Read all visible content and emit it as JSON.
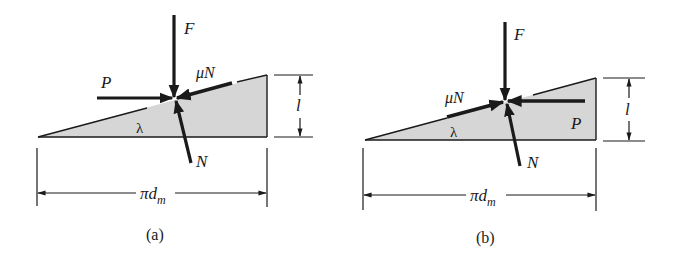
{
  "figure": {
    "colors": {
      "wedge_fill": "#d6d6d6",
      "stroke": "#1a1a1a",
      "background": "#ffffff"
    },
    "panels": [
      {
        "id": "a",
        "caption": "(a)",
        "labels": {
          "F": "F",
          "muN": "μN",
          "P": "P",
          "lambda": "λ",
          "N": "N",
          "lead": "l",
          "circumference": "πd",
          "circumference_sub": "m"
        },
        "forces": [
          {
            "name": "F",
            "direction": "downward"
          },
          {
            "name": "P",
            "direction": "rightward"
          },
          {
            "name": "μN",
            "direction": "down-slope toward contact point"
          },
          {
            "name": "N",
            "direction": "normal to incline, upward"
          }
        ]
      },
      {
        "id": "b",
        "caption": "(b)",
        "labels": {
          "F": "F",
          "muN": "μN",
          "P": "P",
          "lambda": "λ",
          "N": "N",
          "lead": "l",
          "circumference": "πd",
          "circumference_sub": "m"
        },
        "forces": [
          {
            "name": "F",
            "direction": "downward"
          },
          {
            "name": "P",
            "direction": "leftward"
          },
          {
            "name": "μN",
            "direction": "up-slope toward contact point"
          },
          {
            "name": "N",
            "direction": "normal to incline, upward"
          }
        ]
      }
    ]
  }
}
